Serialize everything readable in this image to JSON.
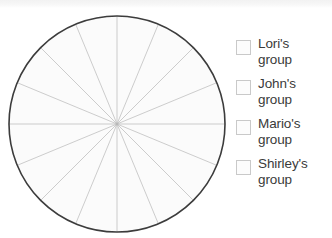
{
  "chart_data": {
    "type": "pie",
    "title": "",
    "categories": [
      "Lori's group",
      "John's group",
      "Mario's group",
      "Shirley's group"
    ],
    "values": [
      4,
      4,
      4,
      4
    ],
    "slice_count": 16,
    "slice_angles_deg": [
      22.5,
      22.5,
      22.5,
      22.5,
      22.5,
      22.5,
      22.5,
      22.5,
      22.5,
      22.5,
      22.5,
      22.5,
      22.5,
      22.5,
      22.5,
      22.5
    ],
    "start_angle_deg": 0,
    "legend_position": "right",
    "grid": false,
    "xlabel": "",
    "ylabel": ""
  },
  "page": {
    "title_partial": "",
    "background_color": "#ffffff"
  },
  "pie": {
    "center_x": 110,
    "center_y": 117,
    "radius": 108,
    "outline_color": "#3c3c3c",
    "outline_width": 1.6,
    "fill_color": "#fbfbfb",
    "divider_color": "#b8b8b8",
    "divider_width": 0.7,
    "slices": 16
  },
  "legend": {
    "swatch_color": "#fcfcfc",
    "swatch_border_color": "#c9c9c9",
    "text_color": "#3a3a3a",
    "items": [
      {
        "name": "Lori's",
        "group_word": "group",
        "label": "Lori's\ngroup"
      },
      {
        "name": "John's",
        "group_word": "group",
        "label": "John's\ngroup"
      },
      {
        "name": "Mario's",
        "group_word": "group",
        "label": "Mario's\ngroup"
      },
      {
        "name": "Shirley's",
        "group_word": "group",
        "label": "Shirley's\ngroup"
      }
    ]
  }
}
